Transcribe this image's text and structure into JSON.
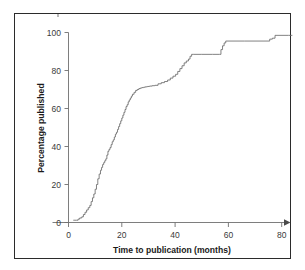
{
  "figure": {
    "frame_visible": true,
    "background_color": "#ffffff",
    "border_color": "#2b2b2b",
    "line_color": "#6a6a6a",
    "text_color": "#1a1a1a"
  },
  "chart_data": {
    "type": "line",
    "subtype": "step-kaplan-meier-cumulative",
    "title": "",
    "subtitle": "",
    "xlabel": "Time to publication (months)",
    "ylabel": "Percentage published",
    "xlim": [
      -4,
      84
    ],
    "ylim": [
      -4,
      103
    ],
    "xticks": [
      0,
      20,
      40,
      60,
      80
    ],
    "xtick_labels": [
      "0",
      "20",
      "40",
      "60",
      "80"
    ],
    "yticks": [
      0,
      20,
      40,
      60,
      80,
      100
    ],
    "ytick_labels": [
      "0",
      "20",
      "40",
      "60",
      "80",
      "100"
    ],
    "grid": false,
    "legend": false,
    "legend_position": "none",
    "axis_arrow_x_end": true,
    "series": [
      {
        "name": "Percentage published",
        "step_type": "post",
        "x": [
          1.8,
          2.4,
          3.0,
          3.6,
          4.2,
          5.0,
          5.6,
          6.2,
          6.8,
          7.4,
          8.0,
          8.5,
          9.0,
          9.5,
          10.0,
          10.5,
          11.0,
          11.5,
          12.0,
          12.4,
          12.8,
          13.2,
          13.6,
          14.0,
          14.4,
          14.8,
          15.2,
          15.6,
          16.0,
          16.4,
          16.8,
          17.2,
          17.6,
          18.0,
          18.4,
          18.8,
          19.2,
          19.6,
          20.0,
          20.4,
          20.8,
          21.2,
          21.6,
          22.0,
          22.4,
          22.8,
          23.2,
          23.6,
          24.0,
          24.6,
          25.2,
          25.8,
          26.4,
          27.0,
          27.6,
          28.2,
          28.8,
          29.6,
          30.4,
          31.4,
          32.4,
          33.6,
          34.8,
          36.0,
          37.2,
          38.2,
          39.2,
          40.2,
          41.0,
          41.8,
          42.6,
          43.4,
          44.2,
          45.0,
          45.6,
          46.2,
          46.8,
          50.0,
          54.0,
          56.6,
          57.2,
          57.8,
          58.4,
          59.0,
          66.0,
          73.0,
          75.5,
          76.5,
          77.5,
          82.5
        ],
        "y": [
          1.2,
          1.2,
          1.2,
          1.8,
          2.4,
          3.0,
          4.2,
          5.4,
          6.6,
          7.8,
          9.0,
          11.0,
          13.0,
          15.0,
          17.5,
          20.0,
          23.0,
          25.5,
          27.5,
          29.0,
          30.5,
          31.5,
          32.5,
          33.5,
          35.5,
          37.5,
          38.5,
          39.5,
          41.0,
          42.5,
          43.5,
          45.0,
          46.5,
          47.5,
          49.0,
          50.5,
          52.0,
          53.5,
          55.0,
          56.5,
          58.0,
          59.5,
          61.0,
          62.0,
          63.5,
          64.5,
          65.5,
          66.5,
          67.5,
          68.5,
          69.5,
          70.0,
          70.5,
          70.8,
          71.0,
          71.2,
          71.4,
          71.6,
          71.8,
          72.0,
          72.2,
          73.0,
          73.6,
          74.2,
          75.0,
          76.0,
          77.0,
          78.0,
          79.5,
          81.0,
          82.5,
          84.0,
          85.0,
          86.0,
          87.5,
          88.5,
          88.5,
          88.5,
          88.5,
          88.5,
          91.0,
          93.0,
          94.5,
          95.5,
          95.5,
          95.5,
          96.5,
          97.0,
          98.5,
          98.5
        ],
        "color": "#6a6a6a"
      }
    ],
    "annotations": []
  }
}
